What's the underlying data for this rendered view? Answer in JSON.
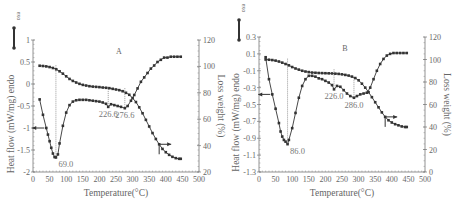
{
  "chart_data": [
    {
      "type": "line",
      "panel_label": "A",
      "title": "A",
      "xlabel": "Temperature(°C)",
      "ylabel_left": "Heat flow (mW/mg) endo",
      "ylabel_right": "Loss weight (%)",
      "exo_label": "exo",
      "xlim": [
        0,
        500
      ],
      "ylim_left": [
        -2,
        1
      ],
      "ylim_right": [
        20,
        120
      ],
      "x_ticks": [
        "0",
        "50",
        "100",
        "150",
        "200",
        "250",
        "300",
        "350",
        "400",
        "450",
        "500"
      ],
      "y_ticks_left": [
        "1",
        "0.5",
        "0",
        "-0.5",
        "-1",
        "-1.5",
        "-2"
      ],
      "y_ticks_right": [
        "120",
        "100",
        "80",
        "60",
        "40",
        "20"
      ],
      "grid": false,
      "series": [
        {
          "name": "Heat flow (DSC)",
          "axis": "left",
          "x": [
            20,
            30,
            40,
            45,
            50,
            55,
            60,
            65,
            69,
            75,
            80,
            90,
            100,
            110,
            120,
            130,
            140,
            150,
            160,
            170,
            180,
            190,
            200,
            210,
            220,
            226.6,
            235,
            245,
            255,
            265,
            276.6,
            285,
            295,
            305,
            315,
            325,
            335,
            345,
            355,
            365,
            375,
            385,
            395,
            405,
            415,
            425,
            435,
            445
          ],
          "values": [
            -0.35,
            -0.7,
            -1.0,
            -1.15,
            -1.3,
            -1.45,
            -1.58,
            -1.66,
            -1.67,
            -1.6,
            -1.35,
            -0.95,
            -0.65,
            -0.48,
            -0.4,
            -0.37,
            -0.36,
            -0.36,
            -0.36,
            -0.37,
            -0.38,
            -0.39,
            -0.4,
            -0.42,
            -0.45,
            -0.52,
            -0.46,
            -0.48,
            -0.5,
            -0.52,
            -0.55,
            -0.5,
            -0.38,
            -0.25,
            -0.1,
            0.05,
            0.15,
            0.25,
            0.35,
            0.42,
            0.5,
            0.55,
            0.6,
            0.6,
            0.62,
            0.62,
            0.62,
            0.62
          ]
        },
        {
          "name": "Loss weight (TG)",
          "axis": "right",
          "x": [
            20,
            30,
            40,
            50,
            60,
            70,
            80,
            90,
            100,
            110,
            120,
            130,
            140,
            150,
            160,
            170,
            180,
            190,
            200,
            210,
            220,
            230,
            240,
            250,
            260,
            270,
            280,
            290,
            300,
            310,
            320,
            330,
            340,
            350,
            360,
            370,
            380,
            390,
            400,
            410,
            420,
            430,
            440,
            445
          ],
          "values": [
            100.5,
            100.3,
            100.0,
            99.5,
            98.8,
            97.8,
            96.3,
            94.5,
            92.5,
            90.5,
            89.0,
            87.8,
            86.8,
            86.0,
            85.5,
            85.0,
            84.7,
            84.5,
            84.3,
            84.0,
            83.8,
            83.5,
            83.0,
            82.5,
            82.0,
            81.2,
            80.0,
            78.5,
            76.0,
            73.0,
            69.0,
            64.5,
            59.5,
            54.5,
            49.5,
            45.0,
            41.0,
            37.5,
            35.0,
            33.0,
            31.5,
            30.5,
            30.0,
            30.0
          ]
        }
      ],
      "annotations": [
        {
          "text": "69.0",
          "x": 69.0,
          "type": "endothermic peak"
        },
        {
          "text": "226.6",
          "x": 226.6
        },
        {
          "text": "276.6",
          "x": 276.6
        }
      ]
    },
    {
      "type": "line",
      "panel_label": "B",
      "title": "B",
      "xlabel": "Temperature(°C)",
      "ylabel_left": "Heat flow (mW/mg) endo",
      "ylabel_right": "Loss weight (%)",
      "exo_label": "exo",
      "xlim": [
        0,
        500
      ],
      "ylim_left": [
        -1.3,
        0.3
      ],
      "ylim_right": [
        0,
        120
      ],
      "x_ticks": [
        "0",
        "50",
        "100",
        "150",
        "200",
        "250",
        "300",
        "350",
        "400",
        "450",
        "500"
      ],
      "y_ticks_left": [
        "0.3",
        "0.1",
        "-0.1",
        "-0.3",
        "-0.5",
        "-0.7",
        "-0.9",
        "-1.1",
        "-1.3"
      ],
      "y_ticks_right": [
        "120",
        "100",
        "80",
        "60",
        "40",
        "20",
        "0"
      ],
      "grid": false,
      "series": [
        {
          "name": "Heat flow (DSC)",
          "axis": "left",
          "x": [
            20,
            30,
            40,
            50,
            60,
            65,
            70,
            75,
            80,
            86,
            90,
            100,
            110,
            120,
            130,
            140,
            150,
            160,
            170,
            180,
            190,
            200,
            210,
            220,
            226,
            235,
            245,
            255,
            265,
            275,
            286,
            295,
            305,
            315,
            325,
            335,
            345,
            355,
            365,
            375,
            385,
            395,
            405,
            415,
            425,
            435,
            445
          ],
          "values": [
            0.06,
            -0.2,
            -0.38,
            -0.55,
            -0.72,
            -0.82,
            -0.88,
            -0.92,
            -0.94,
            -0.97,
            -0.92,
            -0.78,
            -0.6,
            -0.42,
            -0.28,
            -0.2,
            -0.16,
            -0.16,
            -0.17,
            -0.19,
            -0.2,
            -0.22,
            -0.24,
            -0.27,
            -0.32,
            -0.28,
            -0.29,
            -0.33,
            -0.37,
            -0.4,
            -0.42,
            -0.4,
            -0.38,
            -0.37,
            -0.36,
            -0.3,
            -0.2,
            -0.1,
            -0.02,
            0.04,
            0.08,
            0.1,
            0.11,
            0.11,
            0.11,
            0.11,
            0.11
          ]
        },
        {
          "name": "Loss weight (TG)",
          "axis": "right",
          "x": [
            20,
            30,
            40,
            50,
            60,
            70,
            80,
            90,
            100,
            110,
            120,
            130,
            140,
            150,
            160,
            170,
            180,
            190,
            200,
            210,
            220,
            230,
            240,
            250,
            260,
            270,
            280,
            290,
            300,
            310,
            320,
            330,
            340,
            350,
            360,
            370,
            380,
            390,
            400,
            410,
            420,
            430,
            440,
            445
          ],
          "values": [
            100,
            99.8,
            99.5,
            99.0,
            98.2,
            97.2,
            96.0,
            94.8,
            93.3,
            92.0,
            91.0,
            90.0,
            89.3,
            88.8,
            88.4,
            88.2,
            88.0,
            87.9,
            87.8,
            87.7,
            87.6,
            87.4,
            87.2,
            86.8,
            86.3,
            85.7,
            84.8,
            83.5,
            81.5,
            78.5,
            75.0,
            71.0,
            66.5,
            62.0,
            57.5,
            53.0,
            49.0,
            46.0,
            44.0,
            42.5,
            41.5,
            40.5,
            40.0,
            40.0
          ]
        }
      ],
      "annotations": [
        {
          "text": "86.0",
          "x": 86.0,
          "type": "endothermic peak"
        },
        {
          "text": "226.0",
          "x": 226.0
        },
        {
          "text": "286.0",
          "x": 286.0
        }
      ]
    }
  ]
}
